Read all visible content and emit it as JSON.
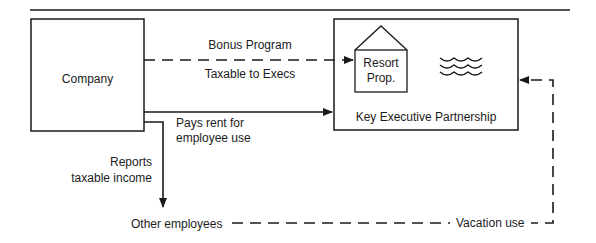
{
  "diagram": {
    "nodes": {
      "company": {
        "label": "Company"
      },
      "partnership": {
        "label": "Key Executive Partnership"
      },
      "resort": {
        "label_line1": "Resort",
        "label_line2": "Prop."
      },
      "other_employees": {
        "label": "Other employees"
      }
    },
    "edges": {
      "bonus": {
        "label_above": "Bonus Program",
        "label_below": "Taxable to Execs",
        "style": "dashed"
      },
      "rent": {
        "label_line1": "Pays rent for",
        "label_line2": "employee use",
        "style": "solid"
      },
      "reports": {
        "label_line1": "Reports",
        "label_line2": "taxable income",
        "style": "solid"
      },
      "vacation": {
        "label": "Vacation use",
        "style": "dashed"
      }
    },
    "icons": [
      "house-icon",
      "water-waves-icon"
    ],
    "colors": {
      "ink": "#1a1a1a",
      "background": "#ffffff"
    }
  }
}
